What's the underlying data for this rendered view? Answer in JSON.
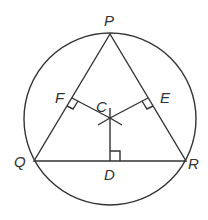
{
  "diagram": {
    "labels": {
      "P": "P",
      "Q": "Q",
      "R": "R",
      "C": "C",
      "D": "D",
      "E": "E",
      "F": "F"
    },
    "colors": {
      "line": "#333333",
      "background": "#ffffff"
    }
  }
}
